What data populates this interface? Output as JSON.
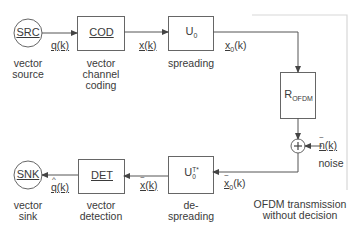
{
  "diagram": {
    "type": "block-diagram",
    "title": "",
    "colors": {
      "stroke": "#555555",
      "frame": "#d8d8d8",
      "text": "#3a3a3a"
    },
    "nodes": {
      "source": {
        "label": "SRC",
        "caption_line1": "vector",
        "caption_line2": "source"
      },
      "coder": {
        "label": "COD",
        "caption_line1": "vector",
        "caption_line2": "channel",
        "caption_line3": "coding"
      },
      "spreader": {
        "label": "U",
        "label_sub": "0",
        "caption": "spreading"
      },
      "channel": {
        "label": "R",
        "label_sub": "OFDM"
      },
      "adder": {
        "label": "+"
      },
      "despreader": {
        "label": "U",
        "label_sub": "0",
        "label_sup": "T*",
        "caption_line1": "de-",
        "caption_line2": "spreading"
      },
      "detector": {
        "label": "DET",
        "caption_line1": "vector",
        "caption_line2": "detection"
      },
      "sink": {
        "label": "SNK",
        "caption_line1": "vector",
        "caption_line2": "sink"
      }
    },
    "signals": {
      "q": "q(k)",
      "x": "x(k)",
      "x0": "x",
      "x0_sub": "0",
      "x0_arg": "(k)",
      "noise": "n(k)",
      "noise_caption": "noise",
      "x0_tilde": "x",
      "x0_tilde_sub": "0",
      "x0_tilde_arg": "(k)",
      "x_tilde": "x(k)",
      "q_hat": "q(k)"
    },
    "frame": {
      "caption_line1": "OFDM transmission",
      "caption_line2": "without decision"
    },
    "edges": [
      {
        "from": "SRC",
        "to": "COD",
        "label": "q(k)"
      },
      {
        "from": "COD",
        "to": "U0",
        "label": "x(k)"
      },
      {
        "from": "U0",
        "to": "R_OFDM",
        "label": "x0(k)"
      },
      {
        "from": "R_OFDM",
        "to": "+"
      },
      {
        "from": "noise",
        "to": "+",
        "label": "n(k)"
      },
      {
        "from": "+",
        "to": "U0T*",
        "label": "x~0(k)"
      },
      {
        "from": "U0T*",
        "to": "DET",
        "label": "x~(k)"
      },
      {
        "from": "DET",
        "to": "SNK",
        "label": "q^(k)"
      }
    ]
  }
}
